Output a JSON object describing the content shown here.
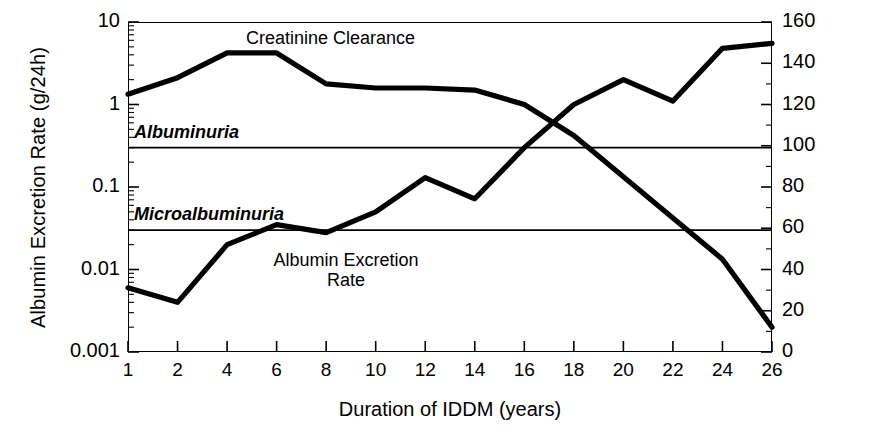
{
  "chart_data": {
    "type": "line",
    "title": "",
    "xlabel": "Duration of IDDM (years)",
    "ylabel": "Albumin Excretion Rate (g/24h)",
    "ylabel_right": "GFR (ml/min/1.73m²)",
    "x": [
      1,
      2,
      4,
      6,
      8,
      10,
      12,
      14,
      16,
      18,
      20,
      22,
      24,
      26
    ],
    "xticks": [
      "1",
      "2",
      "4",
      "6",
      "8",
      "10",
      "12",
      "14",
      "16",
      "18",
      "20",
      "22",
      "24",
      "26"
    ],
    "xlim": [
      1,
      26
    ],
    "yscale": "log",
    "ylim": [
      0.001,
      10
    ],
    "yticks": [
      "10",
      "1",
      "0.1",
      "0.01",
      "0.001"
    ],
    "ytick_values": [
      10,
      1,
      0.1,
      0.01,
      0.001
    ],
    "ylim_right": [
      0,
      160
    ],
    "yticks_right": [
      "160",
      "140",
      "120",
      "100",
      "80",
      "60",
      "40",
      "20",
      "0"
    ],
    "ytick_values_right": [
      160,
      140,
      120,
      100,
      80,
      60,
      40,
      20,
      0
    ],
    "grid": false,
    "legend": "none",
    "series": [
      {
        "name": "Albumin Excretion Rate",
        "axis": "left",
        "units": "g/24h",
        "values": [
          0.006,
          0.004,
          0.02,
          0.035,
          0.028,
          0.05,
          0.13,
          0.072,
          0.3,
          1.0,
          2.0,
          1.1,
          4.8,
          5.5
        ]
      },
      {
        "name": "Creatinine Clearance",
        "axis": "right",
        "units": "ml/min/1.73m2",
        "values": [
          125,
          133,
          145,
          145,
          130,
          128,
          128,
          127,
          120,
          105,
          85,
          65,
          45,
          12
        ]
      }
    ],
    "threshold_lines": [
      {
        "name": "Albuminuria",
        "value": 0.3,
        "axis": "left",
        "label": "Albuminuria"
      },
      {
        "name": "Microalbuminuria",
        "value": 0.03,
        "axis": "left",
        "label": "Microalbuminuria"
      }
    ],
    "annotations": [
      {
        "name": "creatinine-clearance-label",
        "text": "Creatinine Clearance"
      },
      {
        "name": "albumin-excretion-rate-label",
        "line1": "Albumin Excretion",
        "line2": "Rate"
      }
    ],
    "colors": {
      "line": "#000000",
      "threshold": "#000000",
      "axis": "#000000",
      "background": "#ffffff"
    }
  }
}
